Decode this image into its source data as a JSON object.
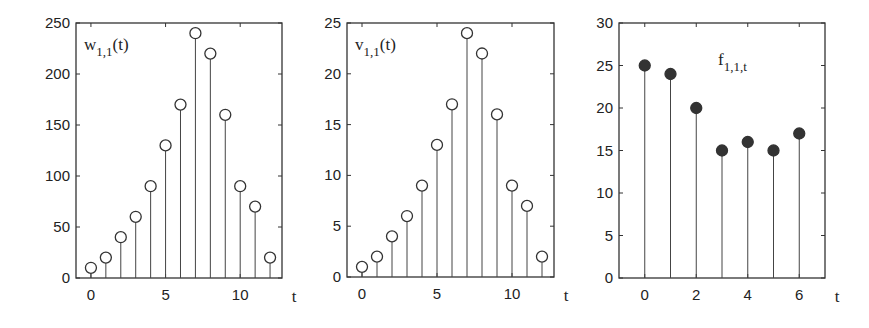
{
  "chart_data": [
    {
      "type": "stem",
      "title": "",
      "label_main": "w",
      "label_sub": "1,1",
      "label_tail": "(t)",
      "xlabel": "t",
      "ylabel": "",
      "marker": "open-circle",
      "x": [
        0,
        1,
        2,
        3,
        4,
        5,
        6,
        7,
        8,
        9,
        10,
        11,
        12
      ],
      "values": [
        10,
        20,
        40,
        60,
        90,
        130,
        170,
        240,
        220,
        160,
        90,
        70,
        20
      ],
      "xlim": [
        -1,
        12.8
      ],
      "ylim": [
        0,
        250
      ],
      "xticks": [
        0,
        5,
        10
      ],
      "yticks": [
        0,
        50,
        100,
        150,
        200,
        250
      ],
      "grid": false,
      "frame": {
        "left": 76,
        "top": 23,
        "right": 282,
        "bottom": 278
      }
    },
    {
      "type": "stem",
      "title": "",
      "label_main": "v",
      "label_sub": "1,1",
      "label_tail": "(t)",
      "xlabel": "t",
      "ylabel": "",
      "marker": "open-circle",
      "x": [
        0,
        1,
        2,
        3,
        4,
        5,
        6,
        7,
        8,
        9,
        10,
        11,
        12
      ],
      "values": [
        1,
        2,
        4,
        6,
        9,
        13,
        17,
        24,
        22,
        16,
        9,
        7,
        2
      ],
      "xlim": [
        -1,
        12.8
      ],
      "ylim": [
        0,
        25
      ],
      "xticks": [
        0,
        5,
        10
      ],
      "yticks": [
        0,
        5,
        10,
        15,
        20,
        25
      ],
      "grid": false,
      "frame": {
        "left": 347,
        "top": 23,
        "right": 554,
        "bottom": 277
      }
    },
    {
      "type": "stem",
      "title": "",
      "label_main": "f",
      "label_sub": "1,1,t",
      "label_tail": "",
      "xlabel": "t",
      "ylabel": "",
      "marker": "filled-circle",
      "x": [
        0,
        1,
        2,
        3,
        4,
        5,
        6
      ],
      "values": [
        25,
        24,
        20,
        15,
        16,
        15,
        17
      ],
      "xlim": [
        -1,
        7
      ],
      "ylim": [
        0,
        30
      ],
      "xticks": [
        0,
        2,
        4,
        6
      ],
      "yticks": [
        0,
        5,
        10,
        15,
        20,
        25,
        30
      ],
      "grid": false,
      "frame": {
        "left": 619,
        "top": 23,
        "right": 825,
        "bottom": 278
      }
    }
  ],
  "colors": {
    "axis": "#333333",
    "stem": "#444444",
    "marker_fill": "#333333",
    "background": "#ffffff"
  }
}
